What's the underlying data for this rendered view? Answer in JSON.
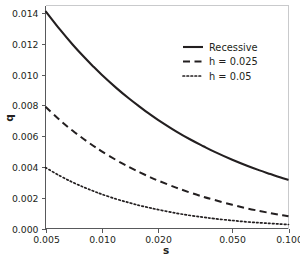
{
  "chart_data": {
    "type": "line",
    "title": "",
    "subtitle": "",
    "xlabel": "s",
    "ylabel": "q",
    "xscale": "log",
    "yscale": "linear",
    "xlim": [
      0.005,
      0.1
    ],
    "ylim": [
      0.0,
      0.0145
    ],
    "grid": false,
    "legend_position": "top-right",
    "xticks": [
      0.005,
      0.01,
      0.02,
      0.05,
      0.1
    ],
    "xticklabels": [
      "0.005",
      "0.010",
      "0.020",
      "0.050",
      "0.100"
    ],
    "yticks": [
      0.0,
      0.002,
      0.004,
      0.006,
      0.008,
      0.01,
      0.012,
      0.014
    ],
    "yticklabels": [
      "0.000",
      "0.002",
      "0.004",
      "0.006",
      "0.008",
      "0.010",
      "0.012",
      "0.014"
    ],
    "x": [
      0.005,
      0.006,
      0.007,
      0.008,
      0.009,
      0.01,
      0.012,
      0.014,
      0.016,
      0.018,
      0.02,
      0.025,
      0.03,
      0.035,
      0.04,
      0.05,
      0.06,
      0.07,
      0.08,
      0.09,
      0.1
    ],
    "series": [
      {
        "name": "Recessive",
        "style": "solid",
        "color": "#231f20",
        "values": [
          0.01414,
          0.01291,
          0.01195,
          0.01118,
          0.01054,
          0.01,
          0.00913,
          0.00845,
          0.00791,
          0.00745,
          0.00707,
          0.00632,
          0.00577,
          0.00535,
          0.005,
          0.00447,
          0.00408,
          0.00378,
          0.00354,
          0.00333,
          0.00316
        ]
      },
      {
        "name": "h = 0.025",
        "style": "dashed",
        "color": "#231f20",
        "values": [
          0.00791,
          0.00702,
          0.00635,
          0.00582,
          0.00538,
          0.00502,
          0.00444,
          0.004,
          0.00365,
          0.00336,
          0.00312,
          0.00266,
          0.00232,
          0.00206,
          0.00186,
          0.00154,
          0.00131,
          0.00114,
          0.001,
          0.00089,
          0.0008
        ]
      },
      {
        "name": "h = 0.05",
        "style": "dotted",
        "color": "#231f20",
        "values": [
          0.00396,
          0.00341,
          0.003,
          0.00269,
          0.00244,
          0.00223,
          0.00191,
          0.00168,
          0.00149,
          0.00135,
          0.00123,
          0.001,
          0.00084,
          0.00073,
          0.00064,
          0.00052,
          0.00043,
          0.00037,
          0.00033,
          0.00029,
          0.00026
        ]
      }
    ]
  },
  "legend": {
    "entries": [
      {
        "label": "Recessive"
      },
      {
        "label": "h = 0.025"
      },
      {
        "label": "h = 0.05"
      }
    ]
  }
}
